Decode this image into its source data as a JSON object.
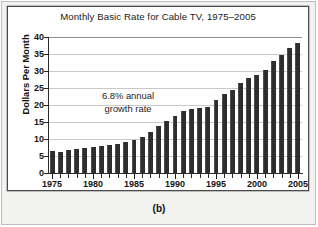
{
  "figure": {
    "caption": "(b)"
  },
  "chart_data": {
    "type": "bar",
    "title": "Monthly Basic Rate for Cable TV, 1975–2005",
    "xlabel": "",
    "ylabel": "Dollars Per Month",
    "ylim": [
      0,
      40
    ],
    "ytick_step": 5,
    "ytick_labels": [
      "0",
      "5",
      "10",
      "15",
      "20",
      "25",
      "30",
      "35",
      "40"
    ],
    "ytick_values": [
      0,
      5,
      10,
      15,
      20,
      25,
      30,
      35,
      40
    ],
    "grid": true,
    "legend": null,
    "xtick_labels": [
      "1975",
      "1980",
      "1985",
      "1990",
      "1995",
      "2000",
      "2005"
    ],
    "xtick_values": [
      1975,
      1980,
      1985,
      1990,
      1995,
      2000,
      2005
    ],
    "categories": [
      1975,
      1976,
      1977,
      1978,
      1979,
      1980,
      1981,
      1982,
      1983,
      1984,
      1985,
      1986,
      1987,
      1988,
      1989,
      1990,
      1991,
      1992,
      1993,
      1994,
      1995,
      1996,
      1997,
      1998,
      1999,
      2000,
      2001,
      2002,
      2003,
      2004,
      2005
    ],
    "values": [
      6.5,
      6.2,
      6.8,
      7.2,
      7.4,
      7.7,
      7.9,
      8.2,
      8.6,
      9.2,
      9.7,
      10.7,
      12.2,
      13.8,
      15.2,
      16.9,
      18.1,
      18.7,
      19.1,
      19.3,
      21.5,
      23.1,
      24.3,
      26.5,
      27.9,
      28.8,
      30.4,
      32.9,
      34.8,
      36.8,
      38.1
    ],
    "annotations": [
      {
        "line1": "6.8% annual",
        "line2": "growth rate"
      }
    ],
    "colors": {
      "bar": "#2e2e2e",
      "grid": "#c9c9c9",
      "axis": "#2a2a2a",
      "plot_background": "#ffffff",
      "panel_background": "#f2f2f0",
      "text": "#141414"
    }
  }
}
